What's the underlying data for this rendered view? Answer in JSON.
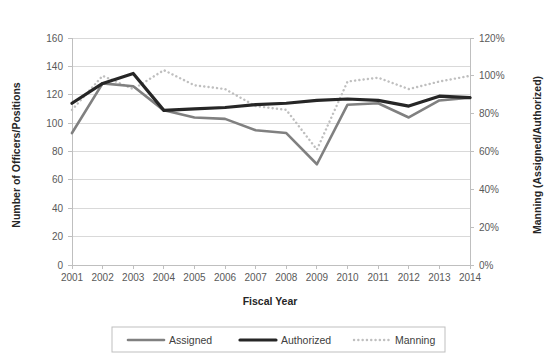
{
  "chart_data": {
    "type": "line",
    "title": "",
    "xlabel": "Fiscal Year",
    "ylabel": "Number of Officers/Positions",
    "y2label": "Manning (Assigned/Authorized)",
    "categories": [
      "2001",
      "2002",
      "2003",
      "2004",
      "2005",
      "2006",
      "2007",
      "2008",
      "2009",
      "2010",
      "2011",
      "2012",
      "2013",
      "2014"
    ],
    "ylim": [
      0,
      160
    ],
    "yticks": [
      0,
      20,
      40,
      60,
      80,
      100,
      120,
      140,
      160
    ],
    "ytick_labels": [
      "0",
      "20",
      "40",
      "60",
      "80",
      "100",
      "120",
      "140",
      "160"
    ],
    "y2lim": [
      0,
      120
    ],
    "y2ticks": [
      0,
      20,
      40,
      60,
      80,
      100,
      120
    ],
    "y2tick_labels": [
      "0%",
      "20%",
      "40%",
      "60%",
      "80%",
      "100%",
      "120%"
    ],
    "grid": true,
    "legend_position": "bottom",
    "series": [
      {
        "name": "Assigned",
        "axis": "left",
        "style": "solid",
        "color": "#808080",
        "width": 2.6,
        "values": [
          93,
          128,
          126,
          109,
          104,
          103,
          95,
          93,
          71,
          113,
          114,
          104,
          116,
          118
        ]
      },
      {
        "name": "Authorized",
        "axis": "left",
        "style": "solid",
        "color": "#262626",
        "width": 3.2,
        "values": [
          114,
          128,
          135,
          109,
          110,
          111,
          113,
          114,
          116,
          117,
          116,
          112,
          119,
          118
        ]
      },
      {
        "name": "Manning",
        "axis": "right",
        "style": "dotted",
        "color": "#bfbfbf",
        "width": 2.4,
        "values": [
          82,
          100,
          93,
          103,
          95,
          93,
          84,
          82,
          61,
          97,
          99,
          93,
          97,
          100
        ]
      }
    ]
  }
}
